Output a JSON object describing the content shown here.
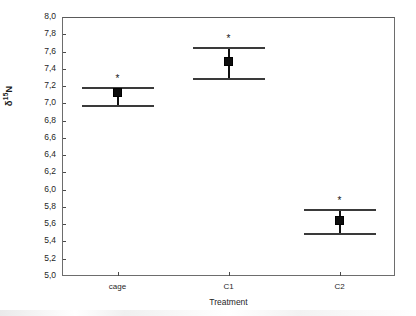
{
  "chart_data": {
    "type": "scatter",
    "title": "",
    "xlabel": "Treatment",
    "ylabel_parts": {
      "delta": "δ",
      "superscript": "15",
      "element": "N"
    },
    "ylabel": "δ 15N",
    "categories": [
      "cage",
      "C1",
      "C2"
    ],
    "values": [
      7.12,
      7.48,
      5.64
    ],
    "error_upper": [
      7.19,
      7.65,
      5.78
    ],
    "error_lower": [
      6.98,
      7.29,
      5.5
    ],
    "annotations": [
      "*",
      "*",
      "*"
    ],
    "ylim": [
      5.0,
      8.0
    ],
    "ytick_labels": [
      "5,0",
      "5,2",
      "5,4",
      "5,6",
      "5,8",
      "6,0",
      "6,2",
      "6,4",
      "6,6",
      "6,8",
      "7,0",
      "7,2",
      "7,4",
      "7,6",
      "7,8",
      "8,0"
    ],
    "ytick_values": [
      5.0,
      5.2,
      5.4,
      5.6,
      5.8,
      6.0,
      6.2,
      6.4,
      6.6,
      6.8,
      7.0,
      7.2,
      7.4,
      7.6,
      7.8,
      8.0
    ],
    "grid": false,
    "legend": "none",
    "marker_style": "filled-square",
    "colors": {
      "marker": "#0d0d0d",
      "error": "#3a3a3a",
      "axis": "#6d6d6d",
      "text": "#1f1f1f"
    }
  }
}
